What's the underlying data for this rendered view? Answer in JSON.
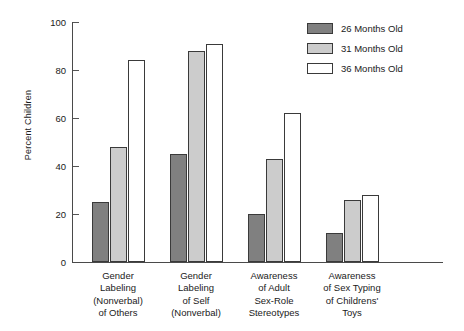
{
  "chart_data": {
    "type": "bar",
    "title": "",
    "xlabel": "",
    "ylabel": "Percent Children",
    "ylim": [
      0,
      100
    ],
    "yticks": [
      0,
      20,
      40,
      60,
      80,
      100
    ],
    "grid": false,
    "legend_position": "top-right",
    "categories": [
      "Gender\nLabeling\n(Nonverbal)\nof Others",
      "Gender\nLabeling\nof Self\n(Nonverbal)",
      "Awareness\nof Adult\nSex-Role\nStereotypes",
      "Awareness\nof Sex Typing\nof Childrens'\nToys"
    ],
    "category_lines": [
      [
        "Gender",
        "Labeling",
        "(Nonverbal)",
        "of Others"
      ],
      [
        "Gender",
        "Labeling",
        "of Self",
        "(Nonverbal)"
      ],
      [
        "Awareness",
        "of Adult",
        "Sex-Role",
        "Stereotypes"
      ],
      [
        "Awareness",
        "of Sex Typing",
        "of Childrens'",
        "Toys"
      ]
    ],
    "series": [
      {
        "name": "26 Months Old",
        "color": "#808080",
        "values": [
          25,
          45,
          20,
          12
        ]
      },
      {
        "name": "31 Months Old",
        "color": "#cccccc",
        "values": [
          48,
          88,
          43,
          26
        ]
      },
      {
        "name": "36 Months Old",
        "color": "#ffffff",
        "values": [
          84,
          91,
          62,
          28
        ]
      }
    ]
  },
  "legend": {
    "items": [
      {
        "label": "26 Months Old",
        "color": "#808080"
      },
      {
        "label": "31 Months Old",
        "color": "#cccccc"
      },
      {
        "label": "36 Months Old",
        "color": "#ffffff"
      }
    ]
  },
  "axis": {
    "y_title": "Percent Children",
    "y_tick_labels": [
      "0",
      "20",
      "40",
      "60",
      "80",
      "100"
    ]
  }
}
